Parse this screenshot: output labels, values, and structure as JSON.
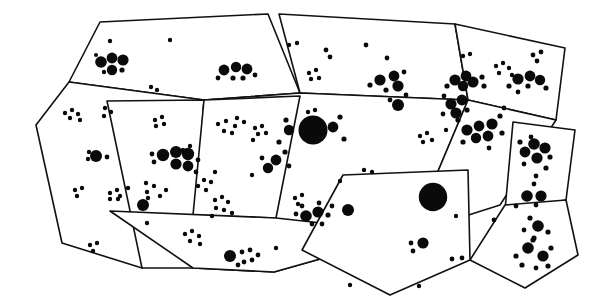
{
  "figure": {
    "title": "Polygonal survey regions with clustered point distribution",
    "type": "diagram",
    "width": 597,
    "height": 308,
    "background_color": "#ffffff",
    "line_color": "#111111",
    "dot_color": "#0a0a0a",
    "line_width": 1.6,
    "visible_text": [],
    "region_count": 12,
    "dot_count_approx": 330
  },
  "regions": [
    {
      "id": "region-top-left",
      "name": "top-left-parcel",
      "points": "100,22 268,14 300,93 204,100 69,82"
    },
    {
      "id": "region-far-left",
      "name": "far-left-parcel",
      "points": "69,82 204,100 192,105 142,268 62,243 36,125"
    },
    {
      "id": "region-left-lower",
      "name": "left-lower-parcel",
      "points": "107,101 204,100 193,268 142,268"
    },
    {
      "id": "region-top-center",
      "name": "top-center-parcel",
      "points": "279,14 455,24 468,100 300,93"
    },
    {
      "id": "region-center-band",
      "name": "center-band-parcel",
      "points": "204,100 300,93 468,100 412,233 274,272 193,268"
    },
    {
      "id": "region-center-left-cell",
      "name": "center-left-cell",
      "points": "204,100 300,96 276,218 193,215"
    },
    {
      "id": "region-bottom-strip",
      "name": "bottom-strip-parcel",
      "points": "110,211 276,218 412,233 274,272 193,268"
    },
    {
      "id": "region-top-right",
      "name": "top-right-parcel",
      "points": "455,24 565,48 556,120 468,100"
    },
    {
      "id": "region-right-mid",
      "name": "right-mid-parcel",
      "points": "468,100 556,120 500,205 412,233"
    },
    {
      "id": "region-right-diamond",
      "name": "right-diamond-parcel",
      "points": "513,122 575,130 566,200 505,210"
    },
    {
      "id": "region-right-lower",
      "name": "right-lower-parcel",
      "points": "505,205 566,200 578,255 525,288 470,260"
    },
    {
      "id": "region-center-pentagon",
      "name": "center-pentagon-parcel",
      "points": "343,175 468,170 470,260 390,295 302,250"
    }
  ],
  "dots": [
    {
      "cx": 110,
      "cy": 41,
      "r": 2.2
    },
    {
      "cx": 170,
      "cy": 40,
      "r": 2.2
    },
    {
      "cx": 101,
      "cy": 62,
      "r": 5.8
    },
    {
      "cx": 112,
      "cy": 58,
      "r": 5.4
    },
    {
      "cx": 123,
      "cy": 60,
      "r": 5.6
    },
    {
      "cx": 112,
      "cy": 70,
      "r": 5.2
    },
    {
      "cx": 122,
      "cy": 70,
      "r": 2.6
    },
    {
      "cx": 104,
      "cy": 72,
      "r": 2.2
    },
    {
      "cx": 96,
      "cy": 55,
      "r": 2.0
    },
    {
      "cx": 151,
      "cy": 87,
      "r": 2.2
    },
    {
      "cx": 157,
      "cy": 90,
      "r": 2.2
    },
    {
      "cx": 224,
      "cy": 70,
      "r": 5.4
    },
    {
      "cx": 236,
      "cy": 67,
      "r": 5.2
    },
    {
      "cx": 247,
      "cy": 69,
      "r": 5.4
    },
    {
      "cx": 233,
      "cy": 78,
      "r": 2.6
    },
    {
      "cx": 243,
      "cy": 78,
      "r": 2.6
    },
    {
      "cx": 218,
      "cy": 78,
      "r": 2.4
    },
    {
      "cx": 255,
      "cy": 75,
      "r": 2.4
    },
    {
      "cx": 65,
      "cy": 113,
      "r": 2.2
    },
    {
      "cx": 72,
      "cy": 110,
      "r": 2.2
    },
    {
      "cx": 78,
      "cy": 114,
      "r": 2.2
    },
    {
      "cx": 70,
      "cy": 118,
      "r": 2.2
    },
    {
      "cx": 80,
      "cy": 120,
      "r": 2.2
    },
    {
      "cx": 105,
      "cy": 108,
      "r": 2.2
    },
    {
      "cx": 111,
      "cy": 112,
      "r": 2.2
    },
    {
      "cx": 104,
      "cy": 116,
      "r": 2.2
    },
    {
      "cx": 89,
      "cy": 152,
      "r": 2.2
    },
    {
      "cx": 88,
      "cy": 159,
      "r": 2.2
    },
    {
      "cx": 96,
      "cy": 156,
      "r": 6.0
    },
    {
      "cx": 107,
      "cy": 157,
      "r": 2.4
    },
    {
      "cx": 75,
      "cy": 190,
      "r": 2.2
    },
    {
      "cx": 82,
      "cy": 188,
      "r": 2.2
    },
    {
      "cx": 77,
      "cy": 196,
      "r": 2.2
    },
    {
      "cx": 110,
      "cy": 193,
      "r": 2.2
    },
    {
      "cx": 117,
      "cy": 190,
      "r": 2.2
    },
    {
      "cx": 110,
      "cy": 199,
      "r": 2.2
    },
    {
      "cx": 118,
      "cy": 199,
      "r": 2.2
    },
    {
      "cx": 155,
      "cy": 120,
      "r": 2.2
    },
    {
      "cx": 162,
      "cy": 117,
      "r": 2.2
    },
    {
      "cx": 156,
      "cy": 126,
      "r": 2.2
    },
    {
      "cx": 164,
      "cy": 124,
      "r": 2.2
    },
    {
      "cx": 163,
      "cy": 155,
      "r": 6.2
    },
    {
      "cx": 176,
      "cy": 152,
      "r": 6.0
    },
    {
      "cx": 188,
      "cy": 154,
      "r": 6.2
    },
    {
      "cx": 176,
      "cy": 164,
      "r": 5.6
    },
    {
      "cx": 188,
      "cy": 166,
      "r": 5.4
    },
    {
      "cx": 152,
      "cy": 154,
      "r": 2.4
    },
    {
      "cx": 154,
      "cy": 162,
      "r": 2.4
    },
    {
      "cx": 198,
      "cy": 160,
      "r": 2.4
    },
    {
      "cx": 196,
      "cy": 172,
      "r": 2.4
    },
    {
      "cx": 146,
      "cy": 183,
      "r": 2.2
    },
    {
      "cx": 154,
      "cy": 186,
      "r": 2.2
    },
    {
      "cx": 166,
      "cy": 190,
      "r": 2.2
    },
    {
      "cx": 147,
      "cy": 192,
      "r": 2.2
    },
    {
      "cx": 160,
      "cy": 196,
      "r": 2.2
    },
    {
      "cx": 148,
      "cy": 198,
      "r": 2.2
    },
    {
      "cx": 143,
      "cy": 205,
      "r": 6.0
    },
    {
      "cx": 128,
      "cy": 188,
      "r": 2.2
    },
    {
      "cx": 120,
      "cy": 196,
      "r": 2.2
    },
    {
      "cx": 215,
      "cy": 200,
      "r": 2.2
    },
    {
      "cx": 222,
      "cy": 197,
      "r": 2.2
    },
    {
      "cx": 228,
      "cy": 202,
      "r": 2.2
    },
    {
      "cx": 216,
      "cy": 208,
      "r": 2.2
    },
    {
      "cx": 224,
      "cy": 210,
      "r": 2.2
    },
    {
      "cx": 212,
      "cy": 216,
      "r": 2.2
    },
    {
      "cx": 232,
      "cy": 213,
      "r": 2.2
    },
    {
      "cx": 218,
      "cy": 124,
      "r": 2.2
    },
    {
      "cx": 226,
      "cy": 121,
      "r": 2.2
    },
    {
      "cx": 235,
      "cy": 126,
      "r": 2.2
    },
    {
      "cx": 224,
      "cy": 131,
      "r": 2.2
    },
    {
      "cx": 232,
      "cy": 133,
      "r": 2.2
    },
    {
      "cx": 185,
      "cy": 234,
      "r": 2.2
    },
    {
      "cx": 192,
      "cy": 231,
      "r": 2.2
    },
    {
      "cx": 199,
      "cy": 236,
      "r": 2.2
    },
    {
      "cx": 190,
      "cy": 241,
      "r": 2.2
    },
    {
      "cx": 200,
      "cy": 244,
      "r": 2.2
    },
    {
      "cx": 147,
      "cy": 223,
      "r": 2.2
    },
    {
      "cx": 230,
      "cy": 256,
      "r": 6.0
    },
    {
      "cx": 242,
      "cy": 252,
      "r": 2.4
    },
    {
      "cx": 250,
      "cy": 250,
      "r": 2.4
    },
    {
      "cx": 244,
      "cy": 262,
      "r": 2.4
    },
    {
      "cx": 252,
      "cy": 260,
      "r": 2.4
    },
    {
      "cx": 238,
      "cy": 265,
      "r": 2.4
    },
    {
      "cx": 258,
      "cy": 255,
      "r": 2.4
    },
    {
      "cx": 289,
      "cy": 45,
      "r": 2.2
    },
    {
      "cx": 297,
      "cy": 43,
      "r": 2.2
    },
    {
      "cx": 326,
      "cy": 50,
      "r": 2.4
    },
    {
      "cx": 330,
      "cy": 57,
      "r": 2.4
    },
    {
      "cx": 366,
      "cy": 45,
      "r": 2.4
    },
    {
      "cx": 387,
      "cy": 58,
      "r": 2.4
    },
    {
      "cx": 309,
      "cy": 73,
      "r": 2.2
    },
    {
      "cx": 316,
      "cy": 70,
      "r": 2.2
    },
    {
      "cx": 311,
      "cy": 79,
      "r": 2.2
    },
    {
      "cx": 319,
      "cy": 78,
      "r": 2.2
    },
    {
      "cx": 380,
      "cy": 80,
      "r": 5.6
    },
    {
      "cx": 394,
      "cy": 76,
      "r": 5.4
    },
    {
      "cx": 398,
      "cy": 86,
      "r": 5.6
    },
    {
      "cx": 386,
      "cy": 90,
      "r": 2.6
    },
    {
      "cx": 370,
      "cy": 85,
      "r": 2.6
    },
    {
      "cx": 404,
      "cy": 72,
      "r": 2.4
    },
    {
      "cx": 406,
      "cy": 95,
      "r": 2.4
    },
    {
      "cx": 390,
      "cy": 100,
      "r": 2.4
    },
    {
      "cx": 398,
      "cy": 105,
      "r": 6.0
    },
    {
      "cx": 308,
      "cy": 112,
      "r": 2.2
    },
    {
      "cx": 315,
      "cy": 110,
      "r": 2.2
    },
    {
      "cx": 306,
      "cy": 120,
      "r": 2.2
    },
    {
      "cx": 313,
      "cy": 130,
      "r": 14.5
    },
    {
      "cx": 289,
      "cy": 130,
      "r": 5.2
    },
    {
      "cx": 333,
      "cy": 127,
      "r": 5.4
    },
    {
      "cx": 286,
      "cy": 120,
      "r": 2.6
    },
    {
      "cx": 340,
      "cy": 117,
      "r": 2.6
    },
    {
      "cx": 344,
      "cy": 139,
      "r": 2.6
    },
    {
      "cx": 279,
      "cy": 142,
      "r": 2.6
    },
    {
      "cx": 276,
      "cy": 160,
      "r": 5.4
    },
    {
      "cx": 268,
      "cy": 168,
      "r": 5.2
    },
    {
      "cx": 285,
      "cy": 152,
      "r": 2.6
    },
    {
      "cx": 262,
      "cy": 158,
      "r": 2.4
    },
    {
      "cx": 289,
      "cy": 166,
      "r": 2.4
    },
    {
      "cx": 255,
      "cy": 128,
      "r": 2.2
    },
    {
      "cx": 262,
      "cy": 126,
      "r": 2.2
    },
    {
      "cx": 258,
      "cy": 134,
      "r": 2.2
    },
    {
      "cx": 266,
      "cy": 133,
      "r": 2.2
    },
    {
      "cx": 253,
      "cy": 140,
      "r": 2.2
    },
    {
      "cx": 237,
      "cy": 118,
      "r": 2.2
    },
    {
      "cx": 244,
      "cy": 122,
      "r": 2.2
    },
    {
      "cx": 364,
      "cy": 170,
      "r": 2.2
    },
    {
      "cx": 372,
      "cy": 172,
      "r": 2.2
    },
    {
      "cx": 295,
      "cy": 198,
      "r": 2.2
    },
    {
      "cx": 302,
      "cy": 195,
      "r": 2.2
    },
    {
      "cx": 298,
      "cy": 204,
      "r": 2.2
    },
    {
      "cx": 306,
      "cy": 216,
      "r": 5.8
    },
    {
      "cx": 318,
      "cy": 212,
      "r": 5.6
    },
    {
      "cx": 328,
      "cy": 215,
      "r": 2.6
    },
    {
      "cx": 296,
      "cy": 214,
      "r": 2.4
    },
    {
      "cx": 312,
      "cy": 224,
      "r": 2.4
    },
    {
      "cx": 322,
      "cy": 224,
      "r": 2.4
    },
    {
      "cx": 332,
      "cy": 206,
      "r": 2.4
    },
    {
      "cx": 302,
      "cy": 206,
      "r": 2.4
    },
    {
      "cx": 319,
      "cy": 203,
      "r": 2.4
    },
    {
      "cx": 348,
      "cy": 210,
      "r": 6.0
    },
    {
      "cx": 433,
      "cy": 197,
      "r": 14.2
    },
    {
      "cx": 423,
      "cy": 243,
      "r": 5.6
    },
    {
      "cx": 411,
      "cy": 243,
      "r": 2.4
    },
    {
      "cx": 413,
      "cy": 251,
      "r": 2.4
    },
    {
      "cx": 456,
      "cy": 216,
      "r": 2.2
    },
    {
      "cx": 452,
      "cy": 259,
      "r": 2.4
    },
    {
      "cx": 462,
      "cy": 258,
      "r": 2.4
    },
    {
      "cx": 463,
      "cy": 56,
      "r": 2.2
    },
    {
      "cx": 470,
      "cy": 54,
      "r": 2.2
    },
    {
      "cx": 533,
      "cy": 55,
      "r": 2.4
    },
    {
      "cx": 541,
      "cy": 52,
      "r": 2.4
    },
    {
      "cx": 537,
      "cy": 61,
      "r": 2.4
    },
    {
      "cx": 496,
      "cy": 66,
      "r": 2.2
    },
    {
      "cx": 503,
      "cy": 63,
      "r": 2.2
    },
    {
      "cx": 509,
      "cy": 68,
      "r": 2.2
    },
    {
      "cx": 499,
      "cy": 73,
      "r": 2.2
    },
    {
      "cx": 512,
      "cy": 75,
      "r": 2.2
    },
    {
      "cx": 455,
      "cy": 80,
      "r": 5.6
    },
    {
      "cx": 466,
      "cy": 76,
      "r": 5.4
    },
    {
      "cx": 473,
      "cy": 82,
      "r": 5.6
    },
    {
      "cx": 463,
      "cy": 86,
      "r": 5.2
    },
    {
      "cx": 482,
      "cy": 77,
      "r": 2.6
    },
    {
      "cx": 484,
      "cy": 86,
      "r": 2.6
    },
    {
      "cx": 447,
      "cy": 86,
      "r": 2.6
    },
    {
      "cx": 518,
      "cy": 79,
      "r": 5.6
    },
    {
      "cx": 530,
      "cy": 76,
      "r": 5.4
    },
    {
      "cx": 540,
      "cy": 80,
      "r": 5.2
    },
    {
      "cx": 528,
      "cy": 86,
      "r": 2.6
    },
    {
      "cx": 509,
      "cy": 86,
      "r": 2.6
    },
    {
      "cx": 546,
      "cy": 88,
      "r": 2.6
    },
    {
      "cx": 518,
      "cy": 92,
      "r": 2.4
    },
    {
      "cx": 451,
      "cy": 104,
      "r": 5.6
    },
    {
      "cx": 462,
      "cy": 100,
      "r": 5.4
    },
    {
      "cx": 456,
      "cy": 113,
      "r": 5.6
    },
    {
      "cx": 467,
      "cy": 110,
      "r": 2.6
    },
    {
      "cx": 444,
      "cy": 96,
      "r": 2.4
    },
    {
      "cx": 443,
      "cy": 114,
      "r": 2.4
    },
    {
      "cx": 504,
      "cy": 108,
      "r": 2.4
    },
    {
      "cx": 420,
      "cy": 136,
      "r": 2.2
    },
    {
      "cx": 427,
      "cy": 133,
      "r": 2.2
    },
    {
      "cx": 423,
      "cy": 142,
      "r": 2.2
    },
    {
      "cx": 432,
      "cy": 140,
      "r": 2.2
    },
    {
      "cx": 446,
      "cy": 130,
      "r": 2.2
    },
    {
      "cx": 467,
      "cy": 130,
      "r": 5.6
    },
    {
      "cx": 479,
      "cy": 126,
      "r": 5.4
    },
    {
      "cx": 492,
      "cy": 124,
      "r": 5.6
    },
    {
      "cx": 476,
      "cy": 138,
      "r": 5.2
    },
    {
      "cx": 488,
      "cy": 136,
      "r": 5.4
    },
    {
      "cx": 463,
      "cy": 142,
      "r": 2.6
    },
    {
      "cx": 500,
      "cy": 116,
      "r": 2.6
    },
    {
      "cx": 502,
      "cy": 133,
      "r": 2.6
    },
    {
      "cx": 458,
      "cy": 120,
      "r": 2.6
    },
    {
      "cx": 489,
      "cy": 148,
      "r": 2.4
    },
    {
      "cx": 531,
      "cy": 137,
      "r": 2.4
    },
    {
      "cx": 534,
      "cy": 144,
      "r": 5.8
    },
    {
      "cx": 545,
      "cy": 148,
      "r": 5.6
    },
    {
      "cx": 525,
      "cy": 152,
      "r": 5.4
    },
    {
      "cx": 537,
      "cy": 158,
      "r": 5.6
    },
    {
      "cx": 550,
      "cy": 157,
      "r": 2.6
    },
    {
      "cx": 520,
      "cy": 142,
      "r": 2.6
    },
    {
      "cx": 546,
      "cy": 168,
      "r": 2.6
    },
    {
      "cx": 524,
      "cy": 164,
      "r": 2.4
    },
    {
      "cx": 536,
      "cy": 176,
      "r": 2.4
    },
    {
      "cx": 534,
      "cy": 184,
      "r": 2.4
    },
    {
      "cx": 527,
      "cy": 196,
      "r": 5.8
    },
    {
      "cx": 541,
      "cy": 196,
      "r": 5.6
    },
    {
      "cx": 536,
      "cy": 205,
      "r": 2.4
    },
    {
      "cx": 516,
      "cy": 206,
      "r": 2.4
    },
    {
      "cx": 494,
      "cy": 220,
      "r": 2.4
    },
    {
      "cx": 538,
      "cy": 226,
      "r": 5.8
    },
    {
      "cx": 530,
      "cy": 218,
      "r": 2.6
    },
    {
      "cx": 548,
      "cy": 232,
      "r": 2.6
    },
    {
      "cx": 534,
      "cy": 238,
      "r": 2.6
    },
    {
      "cx": 524,
      "cy": 230,
      "r": 2.4
    },
    {
      "cx": 528,
      "cy": 248,
      "r": 5.8
    },
    {
      "cx": 543,
      "cy": 256,
      "r": 5.6
    },
    {
      "cx": 533,
      "cy": 240,
      "r": 2.6
    },
    {
      "cx": 516,
      "cy": 256,
      "r": 2.6
    },
    {
      "cx": 522,
      "cy": 265,
      "r": 2.6
    },
    {
      "cx": 551,
      "cy": 248,
      "r": 2.6
    },
    {
      "cx": 548,
      "cy": 266,
      "r": 2.6
    },
    {
      "cx": 536,
      "cy": 268,
      "r": 2.4
    },
    {
      "cx": 340,
      "cy": 181,
      "r": 2.2
    },
    {
      "cx": 252,
      "cy": 175,
      "r": 2.2
    },
    {
      "cx": 215,
      "cy": 172,
      "r": 2.2
    },
    {
      "cx": 204,
      "cy": 180,
      "r": 2.2
    },
    {
      "cx": 211,
      "cy": 182,
      "r": 2.2
    },
    {
      "cx": 198,
      "cy": 186,
      "r": 2.2
    },
    {
      "cx": 206,
      "cy": 190,
      "r": 2.2
    },
    {
      "cx": 190,
      "cy": 146,
      "r": 2.2
    },
    {
      "cx": 183,
      "cy": 150,
      "r": 2.2
    },
    {
      "cx": 90,
      "cy": 245,
      "r": 2.2
    },
    {
      "cx": 97,
      "cy": 243,
      "r": 2.2
    },
    {
      "cx": 93,
      "cy": 251,
      "r": 2.2
    },
    {
      "cx": 276,
      "cy": 248,
      "r": 2.2
    },
    {
      "cx": 350,
      "cy": 285,
      "r": 2.2
    },
    {
      "cx": 419,
      "cy": 286,
      "r": 2.2
    }
  ]
}
